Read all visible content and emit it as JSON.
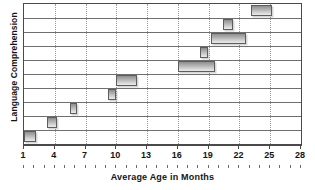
{
  "chart_data": {
    "type": "bar",
    "orientation": "horizontal",
    "title": "",
    "subtitle": "",
    "xlabel": "Average Age in Months",
    "ylabel": "Language Comprehension",
    "xlim": [
      1,
      28
    ],
    "xticks": [
      1,
      4,
      7,
      10,
      13,
      16,
      19,
      22,
      25,
      28
    ],
    "xtick_labels": [
      "1",
      "4",
      "7",
      "10",
      "13",
      "16",
      "19",
      "22",
      "25",
      "28"
    ],
    "grid": "vertical dotted at each major tick; horizontal solid row separators",
    "legend": "none",
    "rows": 10,
    "bar_color": "#a8a8a8",
    "bar_edge_color": "#5d5d5d",
    "series": [
      {
        "name": "Language comprehension milestone age ranges",
        "units": "months",
        "ranges": [
          {
            "row": 1,
            "start": 1,
            "end": 2.2
          },
          {
            "row": 2,
            "start": 3.2,
            "end": 4.2
          },
          {
            "row": 3,
            "start": 5.5,
            "end": 6.2
          },
          {
            "row": 4,
            "start": 9.2,
            "end": 10.0
          },
          {
            "row": 5,
            "start": 10.0,
            "end": 12.0
          },
          {
            "row": 6,
            "start": 16.0,
            "end": 19.6
          },
          {
            "row": 7,
            "start": 18.2,
            "end": 18.9
          },
          {
            "row": 8,
            "start": 19.2,
            "end": 22.6
          },
          {
            "row": 9,
            "start": 20.4,
            "end": 21.4
          },
          {
            "row": 10,
            "start": 23.1,
            "end": 25.2
          }
        ]
      }
    ]
  },
  "axis": {
    "x_title": "Average Age in Months",
    "y_title": "Language Comprehension",
    "x_tick_labels": [
      "1",
      "4",
      "7",
      "10",
      "13",
      "16",
      "19",
      "22",
      "25",
      "28"
    ]
  }
}
